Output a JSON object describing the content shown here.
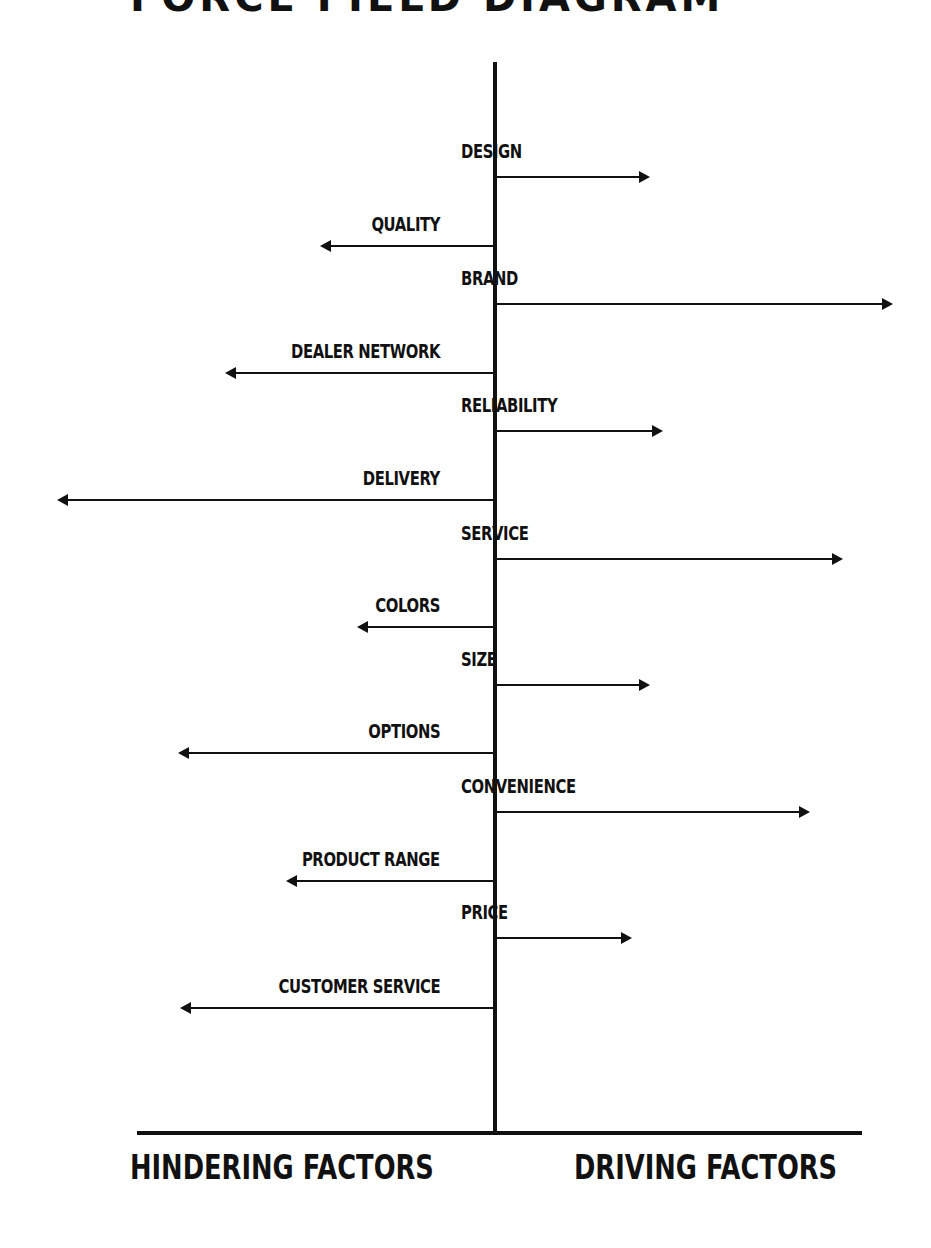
{
  "header": {
    "title": "FORCE FIELD DIAGRAM"
  },
  "axis": {
    "center_x": 495,
    "top_y": 62,
    "baseline_y": 1133,
    "baseline_x1": 137,
    "baseline_x2": 862,
    "left_label": "HINDERING FACTORS",
    "right_label": "DRIVING FACTORS"
  },
  "colors": {
    "line": "#111111",
    "background": "#ffffff"
  },
  "chart_data": {
    "type": "force-field",
    "title": "FORCE FIELD DIAGRAM",
    "left_label": "HINDERING FACTORS",
    "right_label": "DRIVING FACTORS",
    "factors": [
      {
        "label": "DESIGN",
        "side": "driving",
        "y": 177,
        "tip_x": 650,
        "length": 155
      },
      {
        "label": "QUALITY",
        "side": "hindering",
        "y": 246,
        "tip_x": 320,
        "length": 175
      },
      {
        "label": "BRAND",
        "side": "driving",
        "y": 304,
        "tip_x": 893,
        "length": 398
      },
      {
        "label": "DEALER NETWORK",
        "side": "hindering",
        "y": 373,
        "tip_x": 225,
        "length": 270
      },
      {
        "label": "RELIABILITY",
        "side": "driving",
        "y": 431,
        "tip_x": 663,
        "length": 168
      },
      {
        "label": "DELIVERY",
        "side": "hindering",
        "y": 500,
        "tip_x": 57,
        "length": 438
      },
      {
        "label": "SERVICE",
        "side": "driving",
        "y": 559,
        "tip_x": 843,
        "length": 348
      },
      {
        "label": "COLORS",
        "side": "hindering",
        "y": 627,
        "tip_x": 357,
        "length": 138
      },
      {
        "label": "SIZE",
        "side": "driving",
        "y": 685,
        "tip_x": 650,
        "length": 155
      },
      {
        "label": "OPTIONS",
        "side": "hindering",
        "y": 753,
        "tip_x": 178,
        "length": 317
      },
      {
        "label": "CONVENIENCE",
        "side": "driving",
        "y": 812,
        "tip_x": 810,
        "length": 315
      },
      {
        "label": "PRODUCT RANGE",
        "side": "hindering",
        "y": 881,
        "tip_x": 286,
        "length": 209
      },
      {
        "label": "PRICE",
        "side": "driving",
        "y": 938,
        "tip_x": 632,
        "length": 137
      },
      {
        "label": "CUSTOMER SERVICE",
        "side": "hindering",
        "y": 1008,
        "tip_x": 180,
        "length": 315
      }
    ]
  }
}
